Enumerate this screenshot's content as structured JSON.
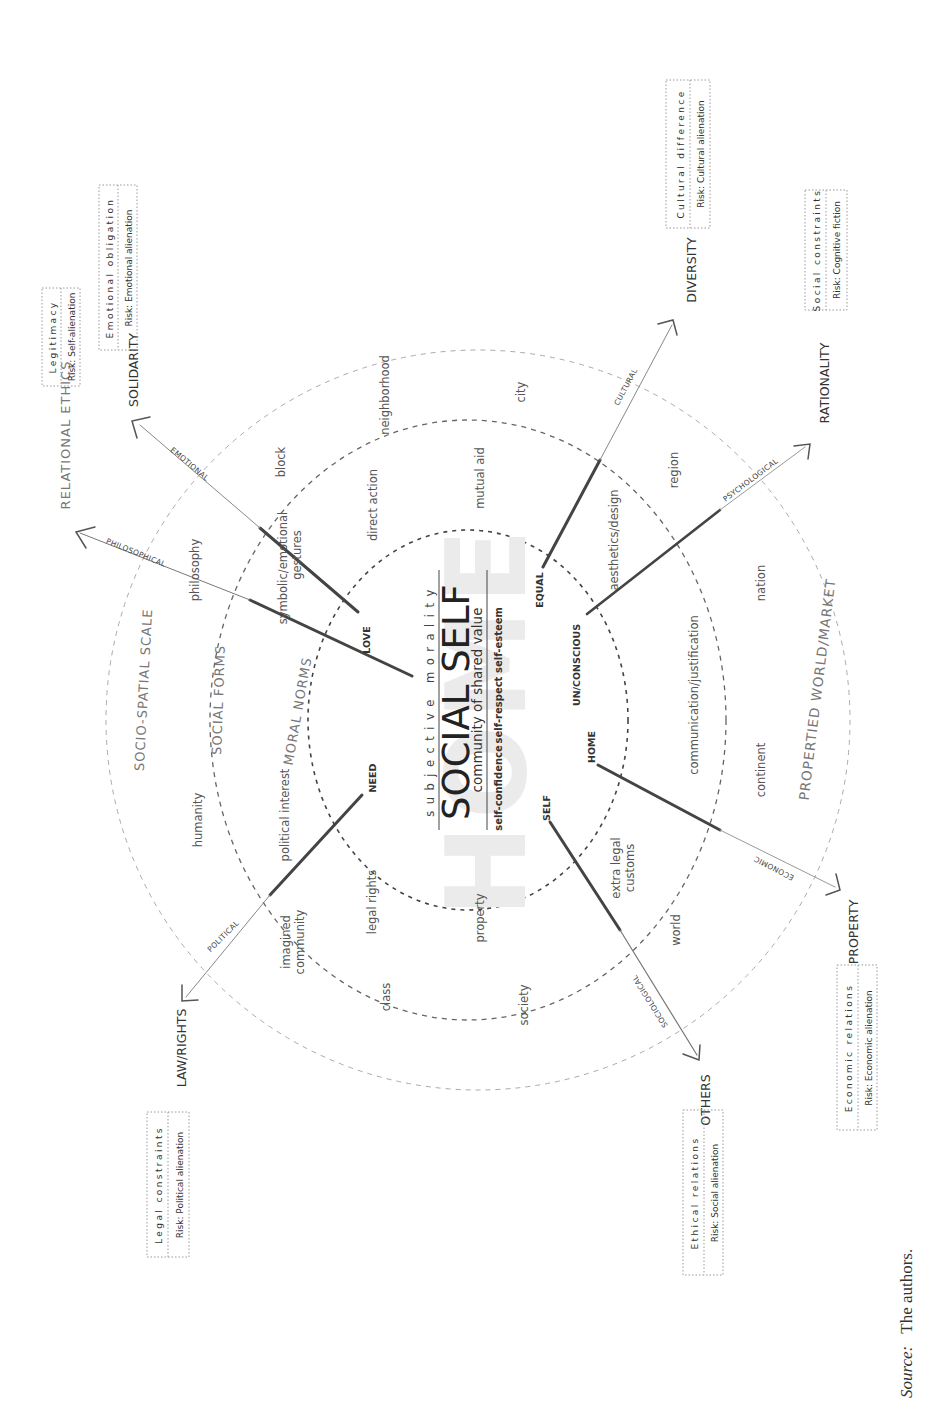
{
  "figure": {
    "orientation": "rotated 90 degrees counter-clockwise",
    "center": {
      "top_label": "subjective morality",
      "title": "SOCIAL SELF",
      "subtitle": "community of shared value",
      "bottom_terms": [
        "self-confidence",
        "self-respect",
        "self-esteem"
      ],
      "watermark": "HOME"
    },
    "rings": [
      {
        "name": "inner",
        "label": "MORAL NORMS",
        "style": "dark dashed"
      },
      {
        "name": "middle",
        "label": "SOCIAL FORMS",
        "style": "medium dashed"
      },
      {
        "name": "outer",
        "label": "SOCIO-SPATIAL SCALE",
        "style": "light dashed"
      }
    ],
    "outer_arc_labels": {
      "left": "RELATIONAL ETHICS",
      "right": "PROPERTIED WORLD/MARKET"
    },
    "moral_norms_terms": [
      "symbolic/emotional gestures",
      "direct action",
      "mutual aid",
      "aesthetics/design",
      "communication/justification",
      "extra legal customs",
      "property",
      "legal rights",
      "political interest"
    ],
    "social_forms_terms": [
      "philosophy",
      "block",
      "neighborhood",
      "city",
      "region",
      "nation",
      "continent",
      "world",
      "society",
      "class",
      "imagined community",
      "humanity"
    ],
    "scale_terms": [
      "philosophy",
      "humanity",
      "block",
      "neighborhood",
      "city",
      "region",
      "nation",
      "continent",
      "world",
      "society",
      "class"
    ],
    "inner_nodes": [
      "LOVE",
      "EQUAL",
      "UN/CONSCIOUS",
      "HOME",
      "SELF",
      "NEED"
    ],
    "axes": [
      {
        "from": "",
        "dimension": "PHILOSOPHICAL",
        "end": "RELATIONAL ETHICS",
        "box_title": "Legitimacy",
        "box_risk": "Risk: Self-alienation"
      },
      {
        "from": "LOVE",
        "dimension": "EMOTIONAL",
        "end": "SOLIDARITY",
        "box_title": "Emotional obligation",
        "box_risk": "Risk: Emotional alienation"
      },
      {
        "from": "EQUAL",
        "dimension": "CULTURAL",
        "end": "DIVERSITY",
        "box_title": "Cultural difference",
        "box_risk": "Risk: Cultural alienation"
      },
      {
        "from": "UN/CONSCIOUS",
        "dimension": "PSYCHOLOGICAL",
        "end": "RATIONALITY",
        "box_title": "Social constraints",
        "box_risk": "Risk: Cognitive fiction"
      },
      {
        "from": "HOME",
        "dimension": "ECONOMIC",
        "end": "PROPERTY",
        "box_title": "Economic relations",
        "box_risk": "Risk: Economic alienation"
      },
      {
        "from": "SELF",
        "dimension": "SOCIOLOGICAL",
        "end": "OTHERS",
        "box_title": "Ethical relations",
        "box_risk": "Risk: Social alienation"
      },
      {
        "from": "NEED",
        "dimension": "POLITICAL",
        "end": "LAW/RIGHTS",
        "box_title": "Legal constraints",
        "box_risk": "Risk: Political alienation"
      }
    ],
    "colors": {
      "ink": "#333333",
      "light_ring": "#aaaaaa",
      "medium_ring": "#666666",
      "dark_ring": "#444444",
      "watermark": "#e6e6e6"
    }
  },
  "caption": {
    "source_label": "Source:",
    "source_text": "The authors."
  }
}
